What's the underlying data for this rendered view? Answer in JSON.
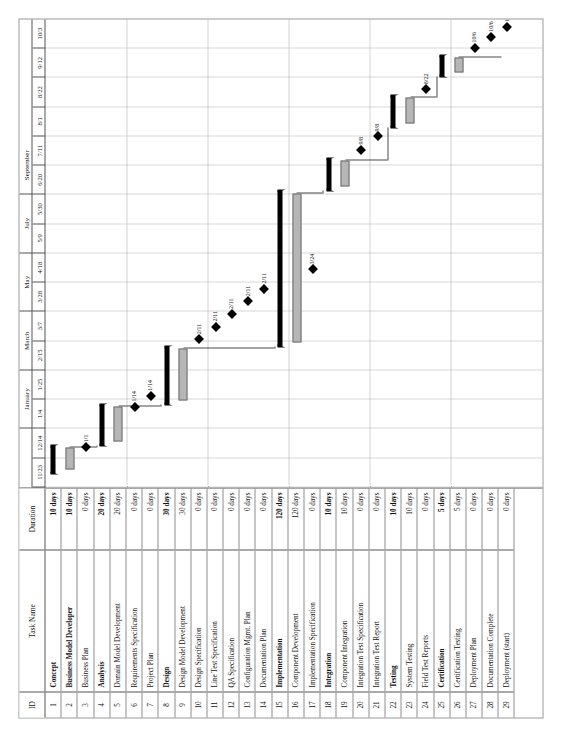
{
  "document": {
    "type": "gantt-chart",
    "orientation": "landscape-rotated"
  },
  "columns": {
    "id": "ID",
    "task_name": "Task Name",
    "duration": "Duration"
  },
  "timeline": {
    "months": [
      {
        "label": "",
        "span": 1
      },
      {
        "label": "January",
        "span": 2
      },
      {
        "label": "",
        "span": 1
      },
      {
        "label": "March",
        "span": 2
      },
      {
        "label": "",
        "span": 1
      },
      {
        "label": "May",
        "span": 2
      },
      {
        "label": "",
        "span": 1
      },
      {
        "label": "July",
        "span": 2
      },
      {
        "label": "",
        "span": 1
      },
      {
        "label": "September",
        "span": 2
      },
      {
        "label": "",
        "span": 1
      }
    ],
    "month_labels": [
      "January",
      "March",
      "May",
      "July",
      "September"
    ],
    "dates": [
      "11/23",
      "12/14",
      "1/4",
      "1/25",
      "2/15",
      "3/7",
      "3/28",
      "4/18",
      "5/9",
      "5/30",
      "6/20",
      "7/11",
      "8/1",
      "8/22",
      "9/12",
      "10/3"
    ]
  },
  "rows": [
    {
      "id": "1",
      "task": "Concept",
      "duration": "10 days",
      "bold": true
    },
    {
      "id": "2",
      "task": "Business Model Developer",
      "duration": "10 days",
      "bold": true
    },
    {
      "id": "3",
      "task": "Business Plan",
      "duration": "0 days",
      "bold": false
    },
    {
      "id": "4",
      "task": "Analysis",
      "duration": "20 days",
      "bold": true
    },
    {
      "id": "5",
      "task": "Domain Model Development",
      "duration": "20 days",
      "bold": false
    },
    {
      "id": "6",
      "task": "Requirements Specification",
      "duration": "0 days",
      "bold": false
    },
    {
      "id": "7",
      "task": "Project Plan",
      "duration": "0 days",
      "bold": false
    },
    {
      "id": "8",
      "task": "Design",
      "duration": "30 days",
      "bold": true
    },
    {
      "id": "9",
      "task": "Design Model Development",
      "duration": "30 days",
      "bold": false
    },
    {
      "id": "10",
      "task": "Design Specification",
      "duration": "0 days",
      "bold": false
    },
    {
      "id": "11",
      "task": "Line Test Specification",
      "duration": "0 days",
      "bold": false
    },
    {
      "id": "12",
      "task": "QA Specification",
      "duration": "0 days",
      "bold": false
    },
    {
      "id": "13",
      "task": "Configuration Mgmt. Plan",
      "duration": "0 days",
      "bold": false
    },
    {
      "id": "14",
      "task": "Documentation Plan",
      "duration": "0 days",
      "bold": false
    },
    {
      "id": "15",
      "task": "Implementation",
      "duration": "120 days",
      "bold": true
    },
    {
      "id": "16",
      "task": "Component Development",
      "duration": "120 days",
      "bold": false
    },
    {
      "id": "17",
      "task": "Implementation Specification",
      "duration": "0 days",
      "bold": false
    },
    {
      "id": "18",
      "task": "Integration",
      "duration": "10 days",
      "bold": true
    },
    {
      "id": "19",
      "task": "Component Integration",
      "duration": "10 days",
      "bold": false
    },
    {
      "id": "20",
      "task": "Integration Test Specification",
      "duration": "0 days",
      "bold": false
    },
    {
      "id": "21",
      "task": "Integration Test Report",
      "duration": "0 days",
      "bold": false
    },
    {
      "id": "22",
      "task": "Testing",
      "duration": "10 days",
      "bold": true
    },
    {
      "id": "23",
      "task": "System Testing",
      "duration": "10 days",
      "bold": false
    },
    {
      "id": "24",
      "task": "Field Test Reports",
      "duration": "0 days",
      "bold": false
    },
    {
      "id": "25",
      "task": "Certification",
      "duration": "5 days",
      "bold": true
    },
    {
      "id": "26",
      "task": "Certification Testing",
      "duration": "5 days",
      "bold": false
    },
    {
      "id": "27",
      "task": "Deployment Plan",
      "duration": "0 days",
      "bold": false
    },
    {
      "id": "28",
      "task": "Documentation Complete",
      "duration": "0 days",
      "bold": false
    },
    {
      "id": "29",
      "task": "Deployment (start)",
      "duration": "0 days",
      "bold": false
    }
  ],
  "chart_data": {
    "type": "gantt",
    "title": "",
    "axis_start": "11/23",
    "axis_end": "10/3",
    "tick_interval_days": 21,
    "bars": [
      {
        "row": 1,
        "kind": "summary",
        "start_pct": 3.0,
        "end_pct": 9.0
      },
      {
        "row": 2,
        "kind": "task",
        "start_pct": 3.8,
        "end_pct": 8.6
      },
      {
        "row": 3,
        "kind": "milestone",
        "at_pct": 8.6,
        "label": "1/1"
      },
      {
        "row": 4,
        "kind": "summary",
        "start_pct": 9.0,
        "end_pct": 17.8
      },
      {
        "row": 5,
        "kind": "task",
        "start_pct": 9.8,
        "end_pct": 17.3
      },
      {
        "row": 6,
        "kind": "milestone",
        "at_pct": 17.3,
        "label": "1/14"
      },
      {
        "row": 7,
        "kind": "milestone",
        "at_pct": 19.6,
        "label": "1/14"
      },
      {
        "row": 8,
        "kind": "summary",
        "start_pct": 17.8,
        "end_pct": 30.2
      },
      {
        "row": 9,
        "kind": "task",
        "start_pct": 18.6,
        "end_pct": 29.7
      },
      {
        "row": 10,
        "kind": "milestone",
        "at_pct": 31.7,
        "label": "2/11"
      },
      {
        "row": 11,
        "kind": "milestone",
        "at_pct": 34.4,
        "label": "2/11"
      },
      {
        "row": 12,
        "kind": "milestone",
        "at_pct": 37.1,
        "label": "2/11"
      },
      {
        "row": 13,
        "kind": "milestone",
        "at_pct": 39.8,
        "label": "2/11"
      },
      {
        "row": 14,
        "kind": "milestone",
        "at_pct": 42.5,
        "label": "2/11"
      },
      {
        "row": 15,
        "kind": "summary",
        "start_pct": 30.2,
        "end_pct": 63.5
      },
      {
        "row": 16,
        "kind": "task",
        "start_pct": 31.0,
        "end_pct": 62.9
      },
      {
        "row": 17,
        "kind": "milestone",
        "at_pct": 46.6,
        "label": "3/24"
      },
      {
        "row": 18,
        "kind": "summary",
        "start_pct": 63.5,
        "end_pct": 70.4
      },
      {
        "row": 19,
        "kind": "task",
        "start_pct": 64.3,
        "end_pct": 69.9
      },
      {
        "row": 20,
        "kind": "milestone",
        "at_pct": 72.2,
        "label": "9/8"
      },
      {
        "row": 21,
        "kind": "milestone",
        "at_pct": 75.0,
        "label": "9/8"
      },
      {
        "row": 22,
        "kind": "summary",
        "start_pct": 77.0,
        "end_pct": 83.8
      },
      {
        "row": 23,
        "kind": "task",
        "start_pct": 77.8,
        "end_pct": 83.3
      },
      {
        "row": 24,
        "kind": "milestone",
        "at_pct": 85.1,
        "label": "8/22"
      },
      {
        "row": 25,
        "kind": "summary",
        "start_pct": 87.8,
        "end_pct": 92.3
      },
      {
        "row": 26,
        "kind": "task",
        "start_pct": 88.6,
        "end_pct": 91.8
      },
      {
        "row": 27,
        "kind": "milestone",
        "at_pct": 94.0,
        "label": "10/6"
      },
      {
        "row": 28,
        "kind": "milestone",
        "at_pct": 96.3,
        "label": "10/6"
      },
      {
        "row": 29,
        "kind": "milestone",
        "at_pct": 98.4,
        "label": "10/6"
      }
    ],
    "links": [
      {
        "from": 2,
        "to": 4
      },
      {
        "from": 5,
        "to": 8
      },
      {
        "from": 9,
        "to": 15
      },
      {
        "from": 16,
        "to": 18
      },
      {
        "from": 19,
        "to": 22
      },
      {
        "from": 23,
        "to": 25
      },
      {
        "from": 26,
        "to": 29
      }
    ],
    "colors": {
      "task_bar_fill": "#b6b6b6",
      "task_bar_border": "#6d6d6d",
      "summary_bar": "#000000",
      "milestone": "#000000",
      "link": "#4a4a4a",
      "grid": "#d8d8d8"
    }
  }
}
